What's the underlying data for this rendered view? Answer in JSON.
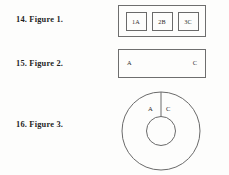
{
  "page": {
    "background_color": "#fdfdfc",
    "ink_color": "#2a2a2a"
  },
  "entries": [
    {
      "number_label": "14. Figure 1.",
      "figure_type": "box-with-three-cells",
      "cells": [
        {
          "label": "1A"
        },
        {
          "label": "2B"
        },
        {
          "label": "3C"
        }
      ]
    },
    {
      "number_label": "15. Figure 2.",
      "figure_type": "rectangle-with-endpoint-labels",
      "left_label": "A",
      "right_label": "C"
    },
    {
      "number_label": "16. Figure 3.",
      "figure_type": "annulus-with-radial-divider",
      "left_label": "A",
      "right_label": "C"
    }
  ]
}
